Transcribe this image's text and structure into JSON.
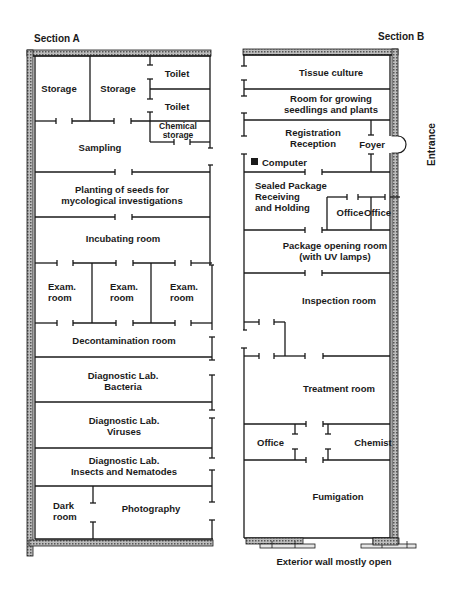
{
  "sections": {
    "a": {
      "label": "Section A",
      "rooms": {
        "storage1": "Storage",
        "storage2": "Storage",
        "toilet1": "Toilet",
        "toilet2": "Toilet",
        "chemical_storage": "Chemical\nstorage",
        "sampling": "Sampling",
        "planting": "Planting of seeds for\nmycological investigations",
        "incubating": "Incubating room",
        "exam1": "Exam.\nroom",
        "exam2": "Exam.\nroom",
        "exam3": "Exam.\nroom",
        "decontamination": "Decontamination room",
        "diag_bacteria": "Diagnostic Lab.\nBacteria",
        "diag_viruses": "Diagnostic Lab.\nViruses",
        "diag_insects": "Diagnostic Lab.\nInsects and Nematodes",
        "dark_room": "Dark\nroom",
        "photography": "Photography"
      }
    },
    "b": {
      "label": "Section B",
      "rooms": {
        "tissue_culture": "Tissue culture",
        "growing": "Room for growing\nseedlings and plants",
        "registration": "Registration\nReception",
        "foyer": "Foyer",
        "computer": "Computer",
        "sealed_package": "Sealed Package\nReceiving\nand Holding",
        "office1": "Office",
        "office2": "Office",
        "package_opening": "Package opening room\n(with UV lamps)",
        "inspection": "Inspection room",
        "treatment": "Treatment room",
        "office3": "Office",
        "chemist": "Chemist",
        "fumigation": "Fumigation"
      }
    }
  },
  "annotations": {
    "entrance": "Entrance",
    "exterior_wall": "Exterior wall mostly open"
  },
  "colors": {
    "line": "#1a1a1a",
    "hatch": "#8a8a8a",
    "background": "#ffffff"
  }
}
